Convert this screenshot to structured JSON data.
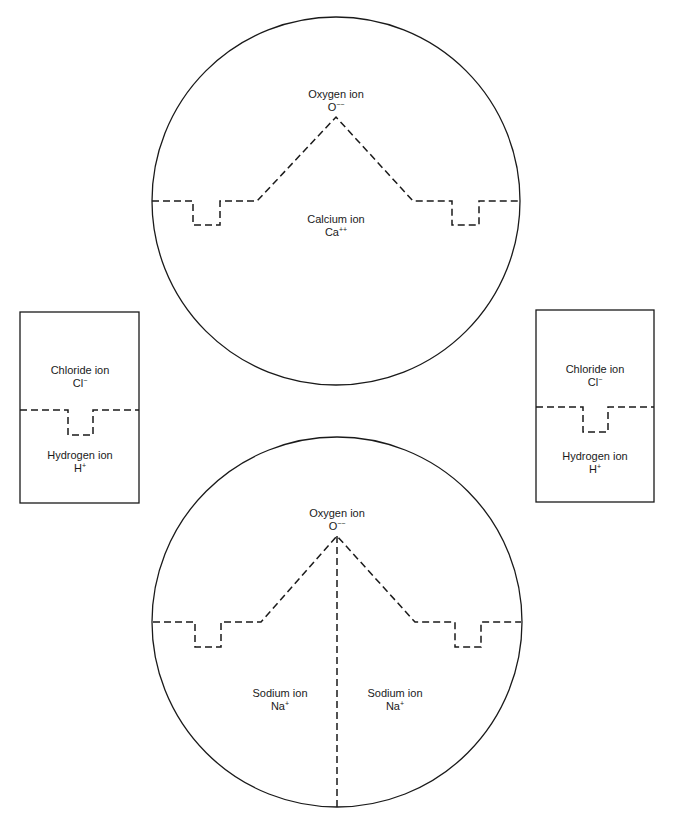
{
  "diagram": {
    "type": "ion-lattice-structure",
    "colors": {
      "stroke": "#1a1a1a",
      "background": "#ffffff",
      "text": "#1a1a1a"
    },
    "top_circle": {
      "upper": {
        "name": "Oxygen ion",
        "symbol": "O",
        "charge": "−−"
      },
      "lower": {
        "name": "Calcium ion",
        "symbol": "Ca",
        "charge": "++"
      }
    },
    "left_box": {
      "upper": {
        "name": "Chloride ion",
        "symbol": "Cl",
        "charge": "−"
      },
      "lower": {
        "name": "Hydrogen ion",
        "symbol": "H",
        "charge": "+"
      }
    },
    "right_box": {
      "upper": {
        "name": "Chloride ion",
        "symbol": "Cl",
        "charge": "−"
      },
      "lower": {
        "name": "Hydrogen ion",
        "symbol": "H",
        "charge": "+"
      }
    },
    "bottom_circle": {
      "upper": {
        "name": "Oxygen ion",
        "symbol": "O",
        "charge": "−−"
      },
      "lower_left": {
        "name": "Sodium ion",
        "symbol": "Na",
        "charge": "+"
      },
      "lower_right": {
        "name": "Sodium ion",
        "symbol": "Na",
        "charge": "+"
      }
    }
  }
}
